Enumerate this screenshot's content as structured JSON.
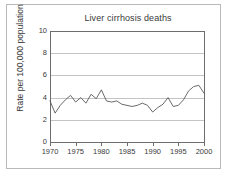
{
  "figure": {
    "border_color": "#b9b9b9",
    "background": "#ffffff"
  },
  "chart_data": {
    "type": "line",
    "title": "Liver cirrhosis deaths",
    "xlabel": "",
    "ylabel": "Rate per 100,000 population",
    "xlim": [
      1970,
      2000
    ],
    "ylim": [
      0,
      10
    ],
    "grid": true,
    "legend": "none",
    "line_color": "#595959",
    "axis_color": "#6d6d6d",
    "grid_color": "#c4c4c4",
    "y_ticks": [
      0,
      2,
      4,
      6,
      8,
      10
    ],
    "y_tick_labels": [
      "0",
      "2",
      "4",
      "6",
      "8",
      "10"
    ],
    "x_ticks": [
      1970,
      1975,
      1980,
      1985,
      1990,
      1995,
      2000
    ],
    "x_tick_labels": [
      "1970",
      "1975",
      "1980",
      "1985",
      "1990",
      "1995",
      "2000"
    ],
    "series": [
      {
        "name": "Liver cirrhosis death rate",
        "x": [
          1970,
          1971,
          1972,
          1973,
          1974,
          1975,
          1976,
          1977,
          1978,
          1979,
          1980,
          1981,
          1982,
          1983,
          1984,
          1985,
          1986,
          1987,
          1988,
          1989,
          1990,
          1991,
          1992,
          1993,
          1994,
          1995,
          1996,
          1997,
          1998,
          1999,
          2000
        ],
        "values": [
          3.7,
          2.6,
          3.3,
          3.8,
          4.2,
          3.6,
          4.0,
          3.5,
          4.3,
          3.9,
          4.7,
          3.7,
          3.6,
          3.7,
          3.4,
          3.3,
          3.2,
          3.3,
          3.5,
          3.3,
          2.7,
          3.1,
          3.4,
          4.0,
          3.2,
          3.3,
          3.8,
          4.6,
          5.0,
          5.1,
          4.4
        ]
      }
    ]
  }
}
